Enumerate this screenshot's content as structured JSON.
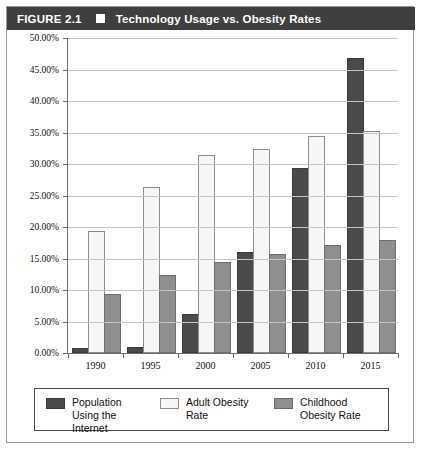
{
  "figure": {
    "number": "FIGURE 2.1",
    "marker_icon": "filled-square-icon",
    "title": "Technology Usage vs. Obesity Rates"
  },
  "colors": {
    "header_background": "#3f3f3f",
    "header_text": "#ffffff",
    "series_internet": "#4a4a4a",
    "series_adult": "#f6f6f4",
    "series_childhood": "#8f8f8f",
    "gridline": "#c4c4c4",
    "axis": "#6f6f6f",
    "frame_border": "#9a9a9a"
  },
  "chart_data": {
    "type": "bar",
    "title": "Technology Usage vs. Obesity Rates",
    "xlabel": "",
    "ylabel": "",
    "categories": [
      "1990",
      "1995",
      "2000",
      "2005",
      "2010",
      "2015"
    ],
    "series": [
      {
        "name": "Population Using the Internet",
        "color": "#4a4a4a",
        "values": [
          0.5,
          0.6,
          5.9,
          15.7,
          29.0,
          46.5
        ]
      },
      {
        "name": "Adult Obesity Rate",
        "color": "#f6f6f4",
        "values": [
          19.1,
          26.1,
          31.1,
          32.1,
          34.2,
          35.0
        ]
      },
      {
        "name": "Childhood Obesity Rate",
        "color": "#8f8f8f",
        "values": [
          9.0,
          12.1,
          14.1,
          15.4,
          16.9,
          17.6
        ]
      }
    ],
    "ylim": [
      0,
      50
    ],
    "ytick_values": [
      0,
      5,
      10,
      15,
      20,
      25,
      30,
      35,
      40,
      45,
      50
    ],
    "ytick_labels": [
      "0.00%",
      "5.00%",
      "10.00%",
      "15.00%",
      "20.00%",
      "25.00%",
      "30.00%",
      "35.00%",
      "40.00%",
      "45.00%",
      "50.00%"
    ],
    "unit": "%",
    "grid": true,
    "legend_position": "bottom"
  },
  "legend": {
    "entries": [
      {
        "label": "Population Using the Internet",
        "swatch": "s0"
      },
      {
        "label": "Adult Obesity Rate",
        "swatch": "s1"
      },
      {
        "label": "Childhood Obesity Rate",
        "swatch": "s2"
      }
    ]
  }
}
